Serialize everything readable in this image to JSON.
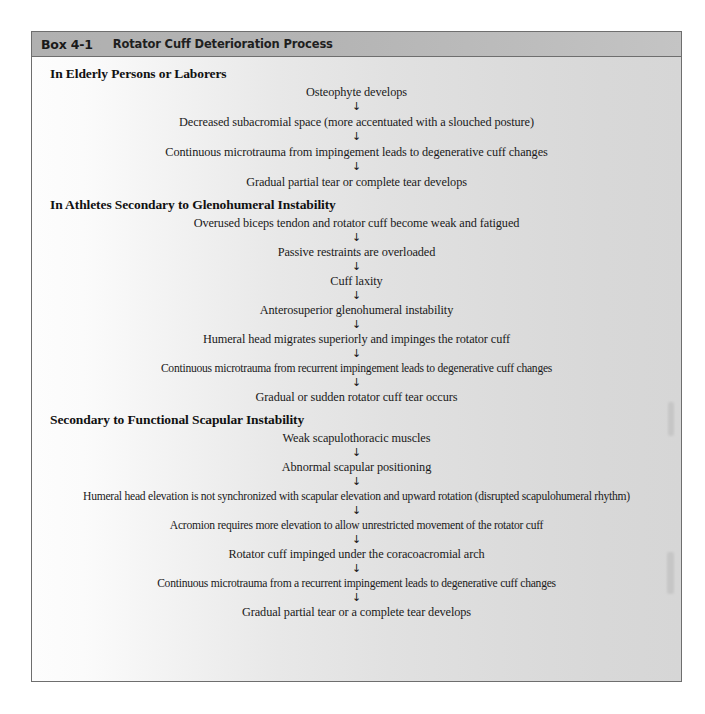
{
  "box": {
    "number_label": "Box 4-1",
    "title": "Rotator Cuff Deterioration Process",
    "arrow_glyph": "↓",
    "colors": {
      "header_band": "#b6b6b6",
      "border": "#6e6e6e",
      "body_light": "#fdfdfd",
      "body_dark": "#d6d6d6",
      "text": "#1a1a1a"
    }
  },
  "sections": [
    {
      "heading": "In Elderly Persons or Laborers",
      "steps": [
        "Osteophyte develops",
        "Decreased subacromial space (more accentuated with a slouched posture)",
        "Continuous microtrauma from impingement leads to degenerative cuff changes",
        "Gradual partial tear or complete tear develops"
      ]
    },
    {
      "heading": "In Athletes Secondary to Glenohumeral Instability",
      "steps": [
        "Overused biceps tendon and rotator cuff become weak and fatigued",
        "Passive restraints are overloaded",
        "Cuff laxity",
        "Anterosuperior glenohumeral instability",
        "Humeral head migrates superiorly and impinges the rotator cuff",
        "Continuous microtrauma from recurrent impingement leads to degenerative cuff changes",
        "Gradual or sudden rotator cuff tear occurs"
      ]
    },
    {
      "heading": "Secondary to Functional Scapular Instability",
      "steps": [
        "Weak scapulothoracic muscles",
        "Abnormal scapular positioning",
        "Humeral head elevation is not synchronized with scapular elevation and upward rotation (disrupted scapulohumeral rhythm)",
        "Acromion requires more elevation to allow unrestricted movement of the rotator cuff",
        "Rotator cuff impinged under the coracoacromial arch",
        "Continuous microtrauma from a recurrent impingement leads to degenerative cuff changes",
        "Gradual partial tear or a complete tear develops"
      ]
    }
  ]
}
